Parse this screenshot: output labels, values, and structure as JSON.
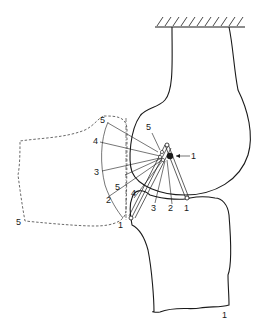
{
  "figure": {
    "type": "mechanism-diagram",
    "colors": {
      "line": "#1a1a1a",
      "background": "#ffffff"
    }
  },
  "labels": {
    "arc_positions": [
      "5",
      "4",
      "3",
      "2",
      "1"
    ],
    "inner_arc": [
      "5",
      "4"
    ],
    "lower_dashed_5": "5",
    "pivot_5": "5",
    "pivot_1": "1",
    "bottom_positions": [
      "3",
      "2",
      "1"
    ],
    "left_link_1": "1",
    "lower_segment_1": "1"
  }
}
